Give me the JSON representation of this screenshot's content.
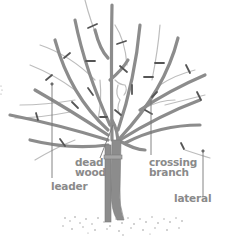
{
  "diagram": {
    "colors": {
      "branch": "#8c8c8c",
      "thin_branch": "#b5b5b5",
      "cut_mark": "#555555",
      "leader_line": "#777777",
      "label_text": "#8a8a8a",
      "soil": "#9a9a9a",
      "background": "#ffffff"
    },
    "labels": {
      "dead_wood": {
        "line1": "dead",
        "line2": "wood"
      },
      "crossing_branch": {
        "line1": "crossing",
        "line2": "branch"
      },
      "leader": {
        "line1": "leader"
      },
      "lateral": {
        "line1": "lateral"
      }
    }
  }
}
